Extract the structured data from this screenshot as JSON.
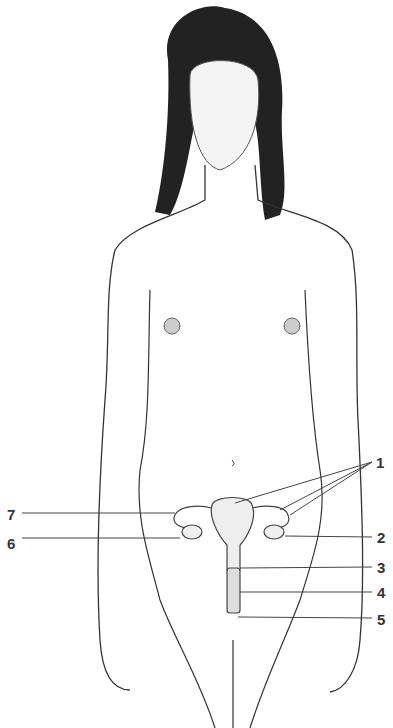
{
  "figure": {
    "labels": [
      {
        "number": "1",
        "x": 376,
        "y": 455
      },
      {
        "number": "2",
        "x": 377,
        "y": 530
      },
      {
        "number": "3",
        "x": 377,
        "y": 560
      },
      {
        "number": "4",
        "x": 377,
        "y": 585
      },
      {
        "number": "5",
        "x": 377,
        "y": 612
      },
      {
        "number": "6",
        "x": 7,
        "y": 536
      },
      {
        "number": "7",
        "x": 7,
        "y": 507
      }
    ]
  }
}
